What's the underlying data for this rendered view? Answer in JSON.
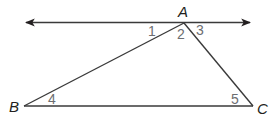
{
  "diagram": {
    "type": "geometry-triangle-with-parallel-line",
    "line": {
      "through": "A",
      "direction": "bidirectional-arrows"
    },
    "vertices": [
      {
        "name": "A",
        "label": "A"
      },
      {
        "name": "B",
        "label": "B"
      },
      {
        "name": "C",
        "label": "C"
      }
    ],
    "angles": [
      {
        "id": "1",
        "label": "1",
        "at": "A",
        "position": "left of AB, below line"
      },
      {
        "id": "2",
        "label": "2",
        "at": "A",
        "position": "interior angle BAC"
      },
      {
        "id": "3",
        "label": "3",
        "at": "A",
        "position": "right of AC, below line"
      },
      {
        "id": "4",
        "label": "4",
        "at": "B",
        "position": "interior angle ABC"
      },
      {
        "id": "5",
        "label": "5",
        "at": "C",
        "position": "interior angle ACB"
      }
    ],
    "colors": {
      "lines": "#3a3a3a",
      "vertex_labels": "#231f20",
      "angle_labels": "#6d6e71"
    }
  }
}
